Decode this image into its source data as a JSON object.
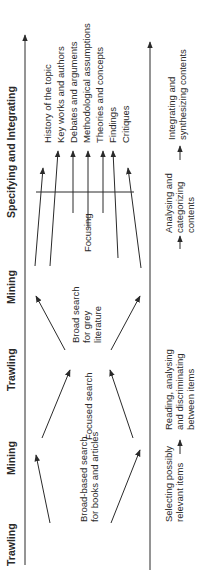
{
  "diagram": {
    "orientation": "rotated 90 degrees counter-clockwise",
    "phases": [
      {
        "label": "Trawling"
      },
      {
        "label": "Mining"
      },
      {
        "label": "Trawling"
      },
      {
        "label": "Mining"
      },
      {
        "label": "Specifying and Integrating"
      }
    ],
    "search_activities": {
      "broad_books": "Broad-based search\nfor books and articles",
      "focused": "Focused search",
      "broad_grey": "Broad search\nfor grey\nliterature",
      "focusing": "Focusing"
    },
    "outcomes": [
      "History of the topic",
      "Key works and authors",
      "Debates and arguments",
      "Methodological assumptions",
      "Theories and concepts",
      "Findings",
      "Critiques"
    ],
    "process_steps": [
      "Selecting possibly\nrelevant items",
      "Reading, analysing\nand discriminating\nbetween items",
      "Analysing and\ncategorizing\ncontents",
      "Integrating and\nsynthesizing contents"
    ],
    "colors": {
      "line": "#2a2a2a",
      "background": "#ffffff"
    }
  }
}
